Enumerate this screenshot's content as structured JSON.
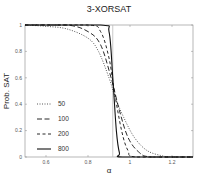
{
  "chart_data": {
    "type": "line",
    "title": "3-XORSAT",
    "xlabel": "α",
    "ylabel": "Prob. SAT",
    "xlim": [
      0.5,
      1.3
    ],
    "ylim": [
      0,
      1
    ],
    "xticks": [
      0.6,
      0.8,
      1,
      1.2
    ],
    "xtick_labels": [
      "0.6",
      "0.8",
      "1",
      "1.2"
    ],
    "yticks": [
      0,
      0.2,
      0.4,
      0.6,
      0.8,
      1
    ],
    "ytick_labels": [
      "0",
      "0.2",
      "0.4",
      "0.6",
      "0.8",
      "1"
    ],
    "grid": false,
    "legend_position": "lower left",
    "threshold_line": 0.918,
    "series": [
      {
        "name": "50",
        "style": "dotted",
        "x": [
          0.5,
          0.6,
          0.7,
          0.8,
          0.85,
          0.9,
          0.93,
          0.97,
          1.02,
          1.08,
          1.15,
          1.2,
          1.3
        ],
        "y": [
          1,
          0.99,
          0.97,
          0.9,
          0.8,
          0.6,
          0.45,
          0.3,
          0.15,
          0.05,
          0.01,
          0,
          0
        ]
      },
      {
        "name": "100",
        "style": "long-dash",
        "x": [
          0.5,
          0.7,
          0.8,
          0.86,
          0.91,
          0.95,
          0.99,
          1.04,
          1.1,
          1.3
        ],
        "y": [
          1,
          1,
          0.95,
          0.85,
          0.6,
          0.35,
          0.15,
          0.04,
          0,
          0
        ]
      },
      {
        "name": "200",
        "style": "dash",
        "x": [
          0.5,
          0.8,
          0.86,
          0.9,
          0.925,
          0.96,
          0.99,
          1.03,
          1.3
        ],
        "y": [
          1,
          1,
          0.95,
          0.75,
          0.5,
          0.2,
          0.05,
          0,
          0
        ]
      },
      {
        "name": "800",
        "style": "solid",
        "x": [
          0.5,
          0.86,
          0.9,
          0.918,
          0.935,
          0.95,
          0.97,
          1.3
        ],
        "y": [
          1,
          1,
          0.95,
          0.6,
          0.2,
          0.03,
          0,
          0
        ]
      }
    ]
  }
}
